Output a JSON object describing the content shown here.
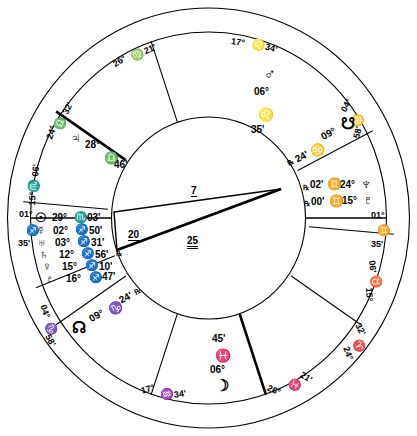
{
  "chart": {
    "type": "astrological-wheel",
    "stroke_color": "#000000",
    "background_color": "#ffffff"
  },
  "house_cusps": [
    {
      "house": "10",
      "degree": "17°",
      "sign_glyph": "♌",
      "sign": "Leo",
      "minute": "34'",
      "position": "top"
    },
    {
      "house": "11",
      "degree": "26°",
      "sign_glyph": "♍",
      "sign": "Virgo",
      "minute": "21'",
      "position": "upper-left"
    },
    {
      "house": "12",
      "degree": "24°",
      "sign_glyph": "♎",
      "sign": "Libra",
      "minute": "32'",
      "position": "left-upper"
    },
    {
      "house": "1",
      "degree": "15°",
      "sign_glyph": "♏",
      "sign": "Scorpio",
      "minute": "06'",
      "position": "left-mid"
    },
    {
      "house": "2",
      "degree": "01°",
      "sign_glyph": "♐",
      "sign": "Sagittarius",
      "minute": "35'",
      "position": "left-asc"
    },
    {
      "house": "3",
      "degree": "04°",
      "sign_glyph": "♑",
      "sign": "Capricorn",
      "minute": "58'",
      "position": "lower-left"
    },
    {
      "house": "4",
      "degree": "17°",
      "sign_glyph": "♒",
      "sign": "Aquarius",
      "minute": "34'",
      "position": "bottom"
    },
    {
      "house": "5",
      "degree": "26°",
      "sign_glyph": "♓",
      "sign": "Pisces",
      "minute": "21'",
      "position": "lower-right"
    },
    {
      "house": "6",
      "degree": "24°",
      "sign_glyph": "♈",
      "sign": "Aries",
      "minute": "32'",
      "position": "right-lower"
    },
    {
      "house": "7",
      "degree": "15°",
      "sign_glyph": "♉",
      "sign": "Taurus",
      "minute": "06'",
      "position": "right-mid"
    },
    {
      "house": "8",
      "degree": "01°",
      "sign_glyph": "♊",
      "sign": "Gemini",
      "minute": "35'",
      "position": "right-desc"
    },
    {
      "house": "9",
      "degree": "04°",
      "sign_glyph": "♋",
      "sign": "Cancer",
      "minute": "58'",
      "position": "upper-right"
    }
  ],
  "planets": {
    "sagittarius_stack": [
      {
        "glyph": "☉",
        "name": "Sun",
        "degree": "29°",
        "sign_glyph": "♏",
        "minute": "03'",
        "retrograde": ""
      },
      {
        "glyph": "☿",
        "name": "Mercury",
        "degree": "02°",
        "sign_glyph": "♐",
        "minute": "50'",
        "retrograde": ""
      },
      {
        "glyph": "♅",
        "name": "Uranus",
        "degree": "03°",
        "sign_glyph": "♐",
        "minute": "31'",
        "retrograde": ""
      },
      {
        "glyph": "♄",
        "name": "Saturn",
        "degree": "12°",
        "sign_glyph": "♐",
        "minute": "56'",
        "retrograde": ""
      },
      {
        "glyph": "♀",
        "name": "Venus",
        "degree": "15°",
        "sign_glyph": "♐",
        "minute": "10'",
        "retrograde": "℞"
      },
      {
        "glyph": "♇",
        "name": "Pluto",
        "degree": "16°",
        "sign_glyph": "♐",
        "minute": "47'",
        "retrograde": ""
      }
    ],
    "mars": {
      "glyph": "♂",
      "name": "Mars",
      "degree": "06°",
      "sign_glyph": "♌",
      "minute": "35'"
    },
    "jupiter": {
      "glyph": "♃",
      "name": "Jupiter",
      "degree": "28°",
      "sign_glyph": "♎",
      "minute": "46'"
    },
    "moon": {
      "glyph": "☽",
      "name": "Moon",
      "degree": "06°",
      "sign_glyph": "♓",
      "minute": "45'"
    },
    "north_node": {
      "glyph": "☊",
      "name": "North Node",
      "degree": "09°",
      "sign_glyph": "♑",
      "minute": "24'",
      "retrograde": "℞"
    },
    "south_node": {
      "glyph": "☋",
      "name": "South Node",
      "degree": "09°",
      "sign_glyph": "♋",
      "minute": "24'",
      "retrograde": "℞"
    },
    "neptune": {
      "glyph": "♆",
      "name": "Neptune",
      "degree": "24°",
      "sign_glyph": "♊",
      "minute": "02'",
      "retrograde": "℞"
    },
    "pluto_gemini": {
      "glyph": "♇",
      "name": "Pluto",
      "degree": "15°",
      "sign_glyph": "♊",
      "minute": "00'",
      "retrograde": "℞"
    }
  },
  "inner_figure": {
    "label_top": "7",
    "label_left": "20",
    "label_right": "25"
  }
}
